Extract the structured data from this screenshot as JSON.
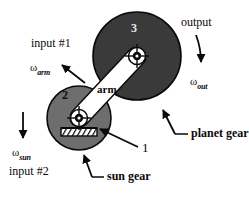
{
  "figure": {
    "background_color": "#ffffff",
    "ink_color": "#0a0a0a"
  },
  "colors": {
    "planet_gear_fill": "#3a3a3a",
    "sun_gear_fill": "#6e6e6e",
    "arm_fill": "#ffffff",
    "outline": "#0a0a0a",
    "label_light": "#e8e8e8"
  },
  "labels": {
    "input_1": "input #1",
    "input_2": "input #2",
    "output": "output",
    "arm": "arm",
    "planet_gear": "planet gear",
    "sun_gear": "sun gear",
    "callout_1": "1",
    "gear_2": "2",
    "gear_3": "3"
  },
  "omegas": {
    "arm": {
      "symbol": "ω",
      "subscript": "arm"
    },
    "sun": {
      "symbol": "ω",
      "subscript": "sun"
    },
    "out": {
      "symbol": "ω",
      "subscript": "out"
    }
  },
  "geometry": {
    "planet_gear": {
      "cx": 137,
      "cy": 56,
      "r": 44
    },
    "sun_gear": {
      "cx": 79,
      "cy": 118,
      "r": 32
    },
    "arm": {
      "x1": 79,
      "y1": 118,
      "x2": 137,
      "y2": 56,
      "half_width": 9
    },
    "pivot_sun": {
      "cx": 79,
      "cy": 118,
      "r": 8
    },
    "pivot_planet": {
      "cx": 137,
      "cy": 56,
      "r": 8
    },
    "ground_hatch": {
      "x": 61,
      "y": 128,
      "w": 36,
      "h": 8
    }
  }
}
